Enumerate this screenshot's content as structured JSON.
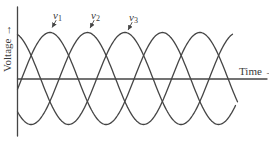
{
  "figure": {
    "background": "#ffffff",
    "line_color": "#454545",
    "text_color": "#3a3a3a"
  },
  "axes": {
    "y_label": "Voltage",
    "y_arrow": "→",
    "x_label": "Time",
    "x_arrow": "→"
  },
  "chart_data": {
    "type": "line",
    "title": "",
    "xlabel": "Time",
    "ylabel": "Voltage",
    "grid": false,
    "axis_numeric_ticks": false,
    "legend_position": "labels-above-peaks",
    "ylim": [
      -1,
      1
    ],
    "x_range_deg": [
      0,
      690
    ],
    "waveform": "v(t) = sin(ωt + φ), three phases 120° apart",
    "series": [
      {
        "name": "v1",
        "base": "v",
        "sub": "1",
        "amplitude": 1,
        "phase_deg": 0
      },
      {
        "name": "v2",
        "base": "v",
        "sub": "2",
        "amplitude": 1,
        "phase_deg": -120
      },
      {
        "name": "v3",
        "base": "v",
        "sub": "3",
        "amplitude": 1,
        "phase_deg": -240
      }
    ],
    "sample_t_deg": [
      0,
      30,
      60,
      90,
      120,
      150,
      180,
      210,
      240,
      270,
      300,
      330,
      360,
      390,
      420,
      450,
      480,
      510,
      540,
      570,
      600,
      630,
      660,
      690
    ],
    "sample_values": {
      "v1": [
        0,
        0.5,
        0.87,
        1,
        0.87,
        0.5,
        0,
        -0.5,
        -0.87,
        -1,
        -0.87,
        -0.5,
        0,
        0.5,
        0.87,
        1,
        0.87,
        0.5,
        0,
        -0.5,
        -0.87,
        -1,
        -0.87,
        -0.5
      ],
      "v2": [
        -0.87,
        -1,
        -0.87,
        -0.5,
        0,
        0.5,
        0.87,
        1,
        0.87,
        0.5,
        0,
        -0.5,
        -0.87,
        -1,
        -0.87,
        -0.5,
        0,
        0.5,
        0.87,
        1,
        0.87,
        0.5,
        0,
        -0.5
      ],
      "v3": [
        0.87,
        0.5,
        0,
        -0.5,
        -0.87,
        -1,
        -0.87,
        -0.5,
        0,
        0.5,
        0.87,
        1,
        0.87,
        0.5,
        0,
        -0.5,
        -0.87,
        -1,
        -0.87,
        -0.5,
        0,
        0.5,
        0.87,
        1
      ]
    }
  }
}
